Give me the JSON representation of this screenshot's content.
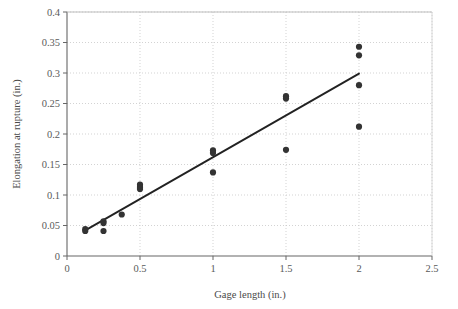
{
  "chart_data": {
    "type": "scatter",
    "title": "",
    "xlabel": "Gage length (in.)",
    "ylabel": "Elongation at rupture (in.)",
    "xlim": [
      0,
      2.5
    ],
    "ylim": [
      0,
      0.4
    ],
    "xticks": [
      0,
      0.5,
      1,
      1.5,
      2,
      2.5
    ],
    "xtick_labels": [
      "0",
      "0.5",
      "1",
      "1.5",
      "2",
      "2.5"
    ],
    "yticks": [
      0,
      0.05,
      0.1,
      0.15,
      0.2,
      0.25,
      0.3,
      0.35,
      0.4
    ],
    "ytick_labels": [
      "0",
      "0.05",
      "0.1",
      "0.15",
      "0.2",
      "0.25",
      "0.3",
      "0.35",
      "0.4"
    ],
    "grid": true,
    "grid_style": "dotted",
    "grid_color": "#c8c8c8",
    "legend": "none",
    "marker_color": "#333333",
    "marker_shape": "circle",
    "line_color": "#222222",
    "series": [
      {
        "name": "Observations",
        "type": "scatter",
        "points": [
          {
            "x": 0.125,
            "y": 0.044
          },
          {
            "x": 0.125,
            "y": 0.041
          },
          {
            "x": 0.25,
            "y": 0.057
          },
          {
            "x": 0.25,
            "y": 0.054
          },
          {
            "x": 0.25,
            "y": 0.041
          },
          {
            "x": 0.375,
            "y": 0.068
          },
          {
            "x": 0.5,
            "y": 0.117
          },
          {
            "x": 0.5,
            "y": 0.113
          },
          {
            "x": 0.5,
            "y": 0.11
          },
          {
            "x": 1.0,
            "y": 0.173
          },
          {
            "x": 1.0,
            "y": 0.169
          },
          {
            "x": 1.0,
            "y": 0.137
          },
          {
            "x": 1.5,
            "y": 0.262
          },
          {
            "x": 1.5,
            "y": 0.258
          },
          {
            "x": 1.5,
            "y": 0.174
          },
          {
            "x": 2.0,
            "y": 0.343
          },
          {
            "x": 2.0,
            "y": 0.329
          },
          {
            "x": 2.0,
            "y": 0.28
          },
          {
            "x": 2.0,
            "y": 0.212
          }
        ]
      },
      {
        "name": "Fitted line",
        "type": "line",
        "points": [
          {
            "x": 0.125,
            "y": 0.042
          },
          {
            "x": 2.0,
            "y": 0.299
          }
        ]
      }
    ]
  }
}
